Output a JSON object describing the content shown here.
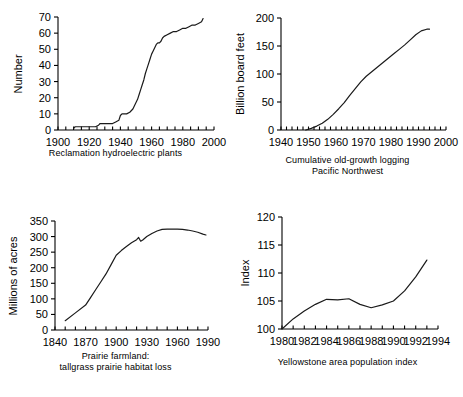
{
  "figure": {
    "background_color": "#ffffff",
    "line_color": "#1a1a1a",
    "axis_color": "#000000",
    "panel_count": 4
  },
  "panels": {
    "hydro": {
      "caption_line1": "Reclamation hydroelectric plants",
      "caption_line2": ""
    },
    "logging": {
      "caption_line1": "Cumulative old-growth logging",
      "caption_line2": "Pacific Northwest"
    },
    "prairie": {
      "caption_line1": "Prairie farmland:",
      "caption_line2": "tallgrass prairie habitat loss"
    },
    "yellowstone": {
      "caption_line1": "Yellowstone area population index",
      "caption_line2": ""
    }
  },
  "chart_data": [
    {
      "id": "hydro",
      "type": "line",
      "title": "Reclamation hydroelectric plants",
      "xlabel": "",
      "ylabel": "Number",
      "xlim": [
        1900,
        2000
      ],
      "ylim": [
        0,
        70
      ],
      "xticks": [
        1900,
        1920,
        1940,
        1960,
        1980,
        2000
      ],
      "xtick_labels": [
        "1900",
        "1920",
        "1940",
        "1960",
        "1980",
        "2000"
      ],
      "minor_xtick_interval": 5,
      "yticks": [
        0,
        10,
        20,
        30,
        40,
        50,
        60,
        70
      ],
      "ytick_labels": [
        "0",
        "10",
        "20",
        "30",
        "40",
        "50",
        "60",
        "70"
      ],
      "grid": false,
      "legend": null,
      "x": [
        1910,
        1911,
        1913,
        1915,
        1920,
        1924,
        1926,
        1927,
        1929,
        1932,
        1935,
        1937,
        1939,
        1940,
        1941,
        1942,
        1943,
        1944,
        1946,
        1948,
        1949,
        1950,
        1951,
        1952,
        1953,
        1954,
        1955,
        1956,
        1957,
        1958,
        1959,
        1960,
        1961,
        1962,
        1963,
        1964,
        1965,
        1966,
        1967,
        1968,
        1970,
        1972,
        1974,
        1976,
        1978,
        1980,
        1982,
        1984,
        1986,
        1988,
        1990,
        1992,
        1993
      ],
      "y": [
        1,
        2,
        2,
        2,
        2,
        2,
        3,
        4,
        4,
        4,
        4,
        5,
        6,
        9,
        10,
        10,
        10,
        10,
        11,
        13,
        15,
        17,
        19,
        22,
        25,
        28,
        31,
        35,
        38,
        41,
        44,
        47,
        49,
        51,
        53,
        54,
        54,
        55,
        57,
        58,
        59,
        60,
        61,
        61,
        62,
        63,
        63,
        64,
        65,
        65,
        66,
        67,
        69
      ]
    },
    {
      "id": "logging",
      "type": "line",
      "title": "Cumulative old-growth logging Pacific Northwest",
      "xlabel": "",
      "ylabel": "Billion board feet",
      "xlim": [
        1940,
        2000
      ],
      "ylim": [
        0,
        200
      ],
      "xticks": [
        1940,
        1950,
        1960,
        1970,
        1980,
        1990,
        2000
      ],
      "xtick_labels": [
        "1940",
        "1950",
        "1960",
        "1970",
        "1980",
        "1990",
        "2000"
      ],
      "minor_xtick_interval": 2,
      "yticks": [
        0,
        50,
        100,
        150,
        200
      ],
      "ytick_labels": [
        "0",
        "50",
        "100",
        "150",
        "200"
      ],
      "grid": false,
      "legend": null,
      "x": [
        1949,
        1951,
        1953,
        1955,
        1957,
        1959,
        1961,
        1963,
        1965,
        1967,
        1969,
        1971,
        1973,
        1975,
        1977,
        1979,
        1981,
        1983,
        1985,
        1987,
        1989,
        1991,
        1993,
        1994
      ],
      "y": [
        0,
        3,
        7,
        12,
        19,
        28,
        38,
        49,
        62,
        74,
        86,
        96,
        104,
        112,
        120,
        128,
        136,
        144,
        152,
        161,
        170,
        177,
        180,
        180
      ]
    },
    {
      "id": "prairie",
      "type": "line",
      "title": "Prairie farmland: tallgrass prairie habitat loss",
      "xlabel": "",
      "ylabel": "Millions of acres",
      "xlim": [
        1840,
        1990
      ],
      "ylim": [
        0,
        350
      ],
      "xticks": [
        1840,
        1870,
        1900,
        1930,
        1960,
        1990
      ],
      "xtick_labels": [
        "1840",
        "1870",
        "1900",
        "1930",
        "1960",
        "1990"
      ],
      "minor_xtick_interval": 10,
      "yticks": [
        0,
        50,
        100,
        150,
        200,
        250,
        300,
        350
      ],
      "ytick_labels": [
        "0",
        "50",
        "100",
        "150",
        "200",
        "250",
        "300",
        "350"
      ],
      "grid": false,
      "legend": null,
      "x": [
        1850,
        1860,
        1870,
        1875,
        1880,
        1885,
        1890,
        1895,
        1900,
        1905,
        1910,
        1915,
        1920,
        1922,
        1924,
        1926,
        1930,
        1935,
        1940,
        1945,
        1950,
        1955,
        1960,
        1965,
        1970,
        1975,
        1980,
        1985,
        1988
      ],
      "y": [
        30,
        55,
        80,
        105,
        130,
        155,
        180,
        210,
        240,
        255,
        268,
        280,
        290,
        297,
        285,
        289,
        300,
        310,
        318,
        323,
        324,
        324,
        324,
        323,
        321,
        318,
        314,
        308,
        305
      ]
    },
    {
      "id": "yellowstone",
      "type": "line",
      "title": "Yellowstone area population index",
      "xlabel": "",
      "ylabel": "Index",
      "xlim": [
        1980,
        1994
      ],
      "ylim": [
        100,
        120
      ],
      "xticks": [
        1980,
        1982,
        1984,
        1986,
        1988,
        1990,
        1992,
        1994
      ],
      "xtick_labels": [
        "1980",
        "1982",
        "1984",
        "1986",
        "1988",
        "1990",
        "1992",
        "1994"
      ],
      "minor_xtick_interval": 1,
      "yticks": [
        100,
        105,
        110,
        115,
        120
      ],
      "ytick_labels": [
        "100",
        "105",
        "110",
        "115",
        "120"
      ],
      "grid": false,
      "legend": null,
      "x": [
        1980,
        1981,
        1982,
        1983,
        1984,
        1985,
        1986,
        1987,
        1988,
        1989,
        1990,
        1991,
        1992,
        1993
      ],
      "y": [
        100.0,
        101.8,
        103.2,
        104.4,
        105.3,
        105.2,
        105.4,
        104.4,
        103.8,
        104.3,
        105.0,
        106.8,
        109.3,
        112.3
      ]
    }
  ]
}
